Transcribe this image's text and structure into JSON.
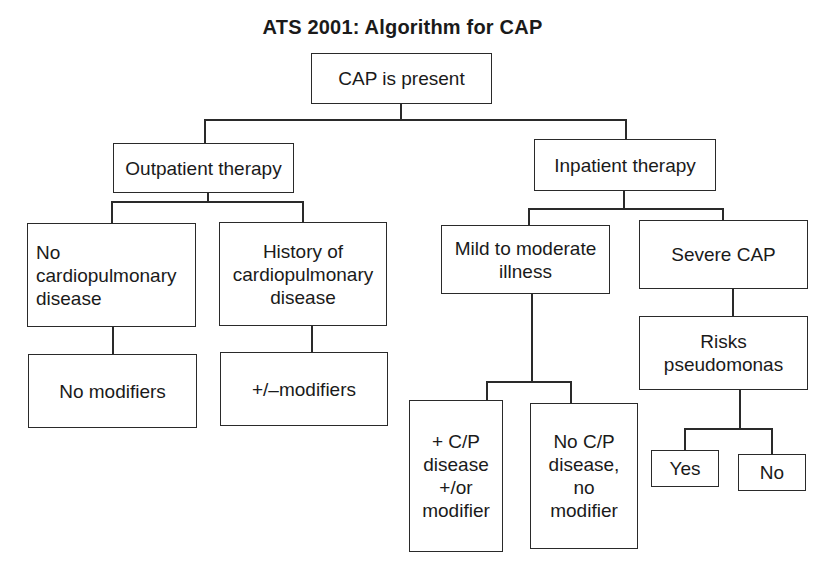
{
  "title": "ATS 2001: Algorithm for CAP",
  "nodes": {
    "root": "CAP is present",
    "outpatient": "Outpatient therapy",
    "inpatient": "Inpatient therapy",
    "no_cardio": "No\ncardiopulmonary\ndisease",
    "history_cardio": "History of\ncardiopulmonary\ndisease",
    "no_modifiers": "No modifiers",
    "pm_modifiers": "+/–modifiers",
    "mild_moderate": "Mild to moderate\nillness",
    "severe": "Severe CAP",
    "risks_pseudomonas": "Risks\npseudomonas",
    "cp_disease_modifier": "+ C/P\ndisease\n+/or\nmodifier",
    "no_cp_disease": "No C/P\ndisease,\nno\nmodifier",
    "yes": "Yes",
    "no": "No"
  },
  "edges": [
    [
      "root",
      "outpatient"
    ],
    [
      "root",
      "inpatient"
    ],
    [
      "outpatient",
      "no_cardio"
    ],
    [
      "outpatient",
      "history_cardio"
    ],
    [
      "no_cardio",
      "no_modifiers"
    ],
    [
      "history_cardio",
      "pm_modifiers"
    ],
    [
      "inpatient",
      "mild_moderate"
    ],
    [
      "inpatient",
      "severe"
    ],
    [
      "mild_moderate",
      "cp_disease_modifier"
    ],
    [
      "mild_moderate",
      "no_cp_disease"
    ],
    [
      "severe",
      "risks_pseudomonas"
    ],
    [
      "risks_pseudomonas",
      "yes"
    ],
    [
      "risks_pseudomonas",
      "no"
    ]
  ]
}
